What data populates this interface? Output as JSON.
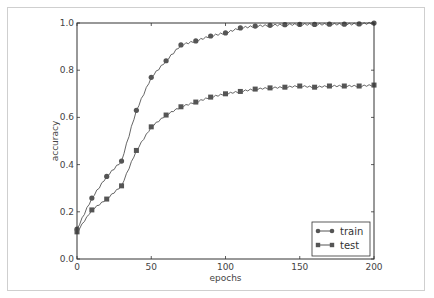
{
  "chart_data": {
    "type": "line",
    "title": "",
    "xlabel": "epochs",
    "ylabel": "accuracy",
    "xlim": [
      0,
      200
    ],
    "ylim": [
      0.0,
      1.0
    ],
    "xticks": [
      0,
      50,
      100,
      150,
      200
    ],
    "xtick_labels": [
      "0",
      "50",
      "100",
      "150",
      "200"
    ],
    "yticks": [
      0.0,
      0.2,
      0.4,
      0.6,
      0.8,
      1.0
    ],
    "ytick_labels": [
      "0.0",
      "0.2",
      "0.4",
      "0.6",
      "0.8",
      "1.0"
    ],
    "grid": false,
    "legend_position": "lower right",
    "x": [
      0,
      10,
      20,
      30,
      40,
      50,
      60,
      70,
      80,
      90,
      100,
      110,
      120,
      130,
      140,
      150,
      160,
      170,
      180,
      190,
      200
    ],
    "series": [
      {
        "name": "train",
        "marker": "circle",
        "values": [
          0.127,
          0.258,
          0.35,
          0.415,
          0.63,
          0.77,
          0.84,
          0.907,
          0.924,
          0.945,
          0.958,
          0.979,
          0.987,
          0.99,
          0.993,
          0.994,
          0.994,
          0.995,
          0.995,
          0.996,
          1.0
        ]
      },
      {
        "name": "test",
        "marker": "square",
        "values": [
          0.115,
          0.208,
          0.254,
          0.31,
          0.46,
          0.56,
          0.61,
          0.645,
          0.665,
          0.686,
          0.7,
          0.71,
          0.72,
          0.725,
          0.728,
          0.733,
          0.728,
          0.733,
          0.733,
          0.733,
          0.737
        ]
      }
    ],
    "colors": {
      "line": "#555555",
      "marker": "#555555",
      "axis": "#333333"
    }
  }
}
